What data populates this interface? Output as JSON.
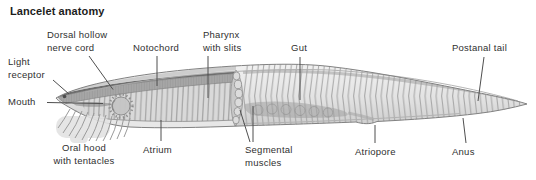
{
  "title": "Lancelet anatomy",
  "labels": {
    "dorsal_nerve_cord": {
      "line1": "Dorsal hollow",
      "line2": "nerve cord"
    },
    "notochord": {
      "line1": "Notochord"
    },
    "pharynx": {
      "line1": "Pharynx",
      "line2": "with slits"
    },
    "gut": {
      "line1": "Gut"
    },
    "postanal_tail": {
      "line1": "Postanal tail"
    },
    "light_receptor": {
      "line1": "Light",
      "line2": "receptor"
    },
    "mouth": {
      "line1": "Mouth"
    },
    "oral_hood": {
      "line1": "Oral hood",
      "line2": "with tentacles"
    },
    "atrium": {
      "line1": "Atrium"
    },
    "segmental_muscles": {
      "line1": "Segmental",
      "line2": "muscles"
    },
    "atriopore": {
      "line1": "Atriopore"
    },
    "anus": {
      "line1": "Anus"
    }
  },
  "colors": {
    "background": "#ffffff",
    "body_light": "#f0f0f0",
    "body_dark": "#cdcdcd",
    "outline": "#828282",
    "notochord": "#a6a6a6",
    "muscle_line": "#a0a0a0",
    "gut": "#8f8f8f",
    "text": "#2f2f2f",
    "leader_line": "#4f4f4f"
  }
}
